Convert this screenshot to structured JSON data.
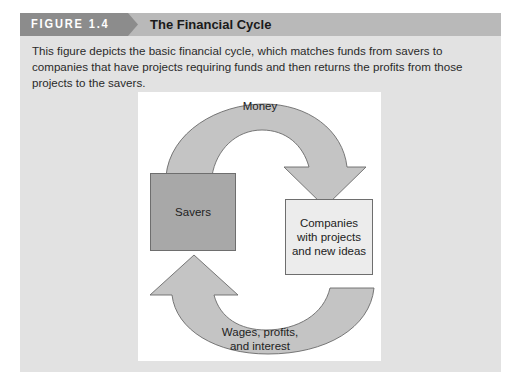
{
  "figure": {
    "tag": "FIGURE 1.4",
    "title": "The Financial Cycle",
    "caption": "This figure depicts the basic financial cycle, which matches funds from savers to companies that have projects requiring funds and then returns the profits from those projects to the savers."
  },
  "diagram": {
    "nodes": [
      {
        "id": "savers",
        "label": "Savers"
      },
      {
        "id": "companies",
        "label": "Companies with projects and new ideas"
      }
    ],
    "edges": [
      {
        "from": "savers",
        "to": "companies",
        "label": "Money"
      },
      {
        "from": "companies",
        "to": "savers",
        "label": "Wages, profits, and interest"
      }
    ],
    "labels": {
      "money": "Money",
      "wages_line1": "Wages, profits,",
      "wages_line2": "and interest",
      "companies_line1": "Companies",
      "companies_line2": "with projects",
      "companies_line3": "and new ideas"
    }
  },
  "colors": {
    "header_tag": "#8c8c8c",
    "header_bar": "#b9b9b9",
    "body_bg": "#e2e2e2",
    "panel_bg": "#ffffff",
    "arrow_fill": "#c4c4c4",
    "savers_fill": "#a8a8a8",
    "companies_fill": "#ececec"
  }
}
